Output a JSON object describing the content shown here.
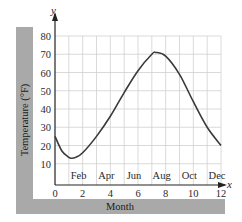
{
  "chart_data": {
    "type": "line",
    "title": "",
    "xlabel": "Month",
    "ylabel": "Temperature (°F)",
    "x_axis_symbol": "x",
    "y_axis_symbol": "y",
    "xlim": [
      0,
      12
    ],
    "ylim": [
      0,
      80
    ],
    "x_ticks": [
      0,
      2,
      4,
      6,
      8,
      10,
      12
    ],
    "y_ticks": [
      10,
      20,
      30,
      40,
      50,
      60,
      70,
      80
    ],
    "month_labels": [
      {
        "x": 2,
        "label": "Feb"
      },
      {
        "x": 4,
        "label": "Apr"
      },
      {
        "x": 6,
        "label": "Jun"
      },
      {
        "x": 8,
        "label": "Aug"
      },
      {
        "x": 10,
        "label": "Oct"
      },
      {
        "x": 12,
        "label": "Dec"
      }
    ],
    "grid": true,
    "grid_x_step": 1,
    "grid_y_step": 10,
    "series": [
      {
        "name": "Temperature",
        "x": [
          0,
          0.5,
          1,
          1.2,
          1.5,
          2,
          3,
          4,
          5,
          6,
          7,
          7.3,
          8,
          9,
          10,
          11,
          12
        ],
        "values": [
          25,
          17,
          13.5,
          13,
          13.5,
          16,
          25,
          36,
          49,
          61,
          70,
          71,
          69,
          59,
          44,
          30,
          20
        ]
      }
    ],
    "colors": {
      "curve": "#3a3a3a",
      "grid": "#d0d0d0",
      "band": "#a9a9a9",
      "axis": "#222222"
    }
  },
  "labels": {
    "ylabel": "Temperature (°F)",
    "xlabel": "Month",
    "x_symbol": "x",
    "y_symbol": "y"
  }
}
